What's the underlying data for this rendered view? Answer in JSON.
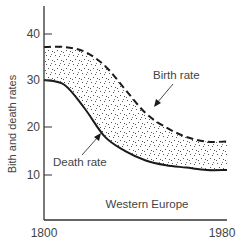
{
  "chart_data": {
    "type": "area",
    "title": "",
    "subtitle": "Western Europe",
    "xlabel": "",
    "ylabel": "Bith and death rates",
    "xlim": [
      1800,
      1980
    ],
    "ylim": [
      5,
      46
    ],
    "x_ticks": [
      1800,
      1980
    ],
    "y_ticks": [
      10,
      20,
      30,
      40
    ],
    "grid": false,
    "legend": "none (direct labels with arrows)",
    "x": [
      1800,
      1820,
      1840,
      1860,
      1880,
      1900,
      1920,
      1940,
      1960,
      1980
    ],
    "series": [
      {
        "name": "Birth rate",
        "style": "dashed",
        "values": [
          37,
          37,
          36,
          33,
          28,
          23,
          20,
          18,
          17,
          17
        ]
      },
      {
        "name": "Death rate",
        "style": "solid",
        "values": [
          30,
          29,
          24,
          18,
          15,
          13,
          12,
          11.5,
          11,
          11
        ]
      }
    ],
    "fill_between": {
      "upper": "Birth rate",
      "lower": "Death rate",
      "pattern": "stippled dots"
    },
    "annotations": [
      {
        "text": "Birth rate",
        "points_to": [
          1870,
          26
        ]
      },
      {
        "text": "Death rate",
        "points_to": [
          1850,
          19
        ]
      },
      {
        "text": "Western Europe",
        "position": "bottom-center inside axes"
      }
    ]
  },
  "labels": {
    "ylabel": "Bith and death rates",
    "region": "Western Europe",
    "birth": "Birth rate",
    "death": "Death rate",
    "x_start": "1800",
    "x_end": "1980",
    "y10": "10",
    "y20": "20",
    "y30": "30",
    "y40": "40"
  },
  "colors": {
    "line": "#1a1a1a",
    "text": "#444444",
    "stipple": "#555555",
    "background": "#ffffff"
  }
}
